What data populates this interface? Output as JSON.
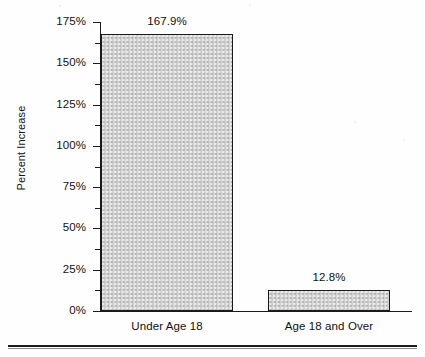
{
  "chart_data": {
    "type": "bar",
    "title": "",
    "subtitle": "",
    "xlabel": "",
    "ylabel": "Percent Increase",
    "categories": [
      "Under Age 18",
      "Age 18 and Over"
    ],
    "values": [
      167.9,
      12.8
    ],
    "value_labels": [
      "167.9%",
      "12.8%"
    ],
    "ylim": [
      0,
      175
    ],
    "y_major_step": 25,
    "y_minor_step": 12.5,
    "y_tick_labels": [
      "0%",
      "25%",
      "50%",
      "75%",
      "100%",
      "125%",
      "150%",
      "175%"
    ],
    "y_tick_values": [
      0,
      25,
      50,
      75,
      100,
      125,
      150,
      175
    ],
    "y_minor_tick_values": [
      12.5,
      37.5,
      62.5,
      87.5,
      112.5,
      137.5,
      162.5
    ],
    "grid": false,
    "legend": false,
    "legend_position": "none",
    "series": [
      {
        "name": "Percent Increase",
        "values": [
          167.9,
          12.8
        ]
      }
    ],
    "colors": {
      "bar_fill": "#d2d2d2",
      "bar_border": "#1a1a1a",
      "axis": "#1b1b1b",
      "text": "#101010",
      "background": "#ffffff",
      "rule": "#1c1c1c"
    }
  },
  "axis": {
    "y_label": "Percent Increase",
    "ticks": [
      {
        "label": "175%",
        "value": 175
      },
      {
        "label": "150%",
        "value": 150
      },
      {
        "label": "125%",
        "value": 125
      },
      {
        "label": "100%",
        "value": 100
      },
      {
        "label": "75%",
        "value": 75
      },
      {
        "label": "50%",
        "value": 50
      },
      {
        "label": "25%",
        "value": 25
      },
      {
        "label": "0%",
        "value": 0
      }
    ]
  },
  "bars": [
    {
      "category": "Under Age 18",
      "value": 167.9,
      "value_label": "167.9%"
    },
    {
      "category": "Age 18 and Over",
      "value": 12.8,
      "value_label": "12.8%"
    }
  ]
}
